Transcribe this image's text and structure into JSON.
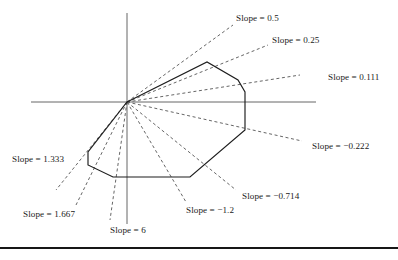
{
  "figure": {
    "title": "",
    "width": 398,
    "height": 260,
    "origin": {
      "x": 127,
      "y": 102
    },
    "axes": {
      "horizontal": {
        "x1": 31,
        "y1": 102,
        "x2": 316,
        "y2": 102
      },
      "vertical": {
        "x1": 127,
        "y1": 13,
        "x2": 127,
        "y2": 224
      }
    },
    "footer_rule": {
      "x1": 0,
      "y1": 248,
      "x2": 398,
      "y2": 248
    },
    "polygon": {
      "closed": true,
      "points": [
        {
          "x": 127,
          "y": 102
        },
        {
          "x": 207,
          "y": 62
        },
        {
          "x": 238,
          "y": 80
        },
        {
          "x": 245,
          "y": 92
        },
        {
          "x": 245,
          "y": 130
        },
        {
          "x": 190,
          "y": 177
        },
        {
          "x": 113,
          "y": 177
        },
        {
          "x": 88,
          "y": 165
        },
        {
          "x": 88,
          "y": 152
        }
      ]
    },
    "rays": [
      {
        "id": "ray-0-5",
        "slope": 0.5,
        "x2": 233,
        "y2": 25
      },
      {
        "id": "ray-0-25",
        "slope": 0.25,
        "x2": 268,
        "y2": 45
      },
      {
        "id": "ray-0-111",
        "slope": 0.111,
        "x2": 300,
        "y2": 75
      },
      {
        "id": "ray--0-222",
        "slope": -0.222,
        "x2": 302,
        "y2": 141
      },
      {
        "id": "ray--0-714",
        "slope": -0.714,
        "x2": 236,
        "y2": 190
      },
      {
        "id": "ray--1-2",
        "slope": -1.2,
        "x2": 186,
        "y2": 202
      },
      {
        "id": "ray-6",
        "slope": 6,
        "x2": 110,
        "y2": 220
      },
      {
        "id": "ray-1-667",
        "slope": 1.667,
        "x2": 76,
        "y2": 205
      },
      {
        "id": "ray-1-333",
        "slope": 1.333,
        "x2": 56,
        "y2": 190
      }
    ],
    "labels": [
      {
        "id": "label-0-5",
        "text": "Slope = 0.5",
        "x": 236,
        "y": 14
      },
      {
        "id": "label-0-25",
        "text": "Slope = 0.25",
        "x": 272,
        "y": 36
      },
      {
        "id": "label-0-111",
        "text": "Slope = 0.111",
        "x": 328,
        "y": 73
      },
      {
        "id": "label--0-222",
        "text": "Slope = −0.222",
        "x": 312,
        "y": 142
      },
      {
        "id": "label--0-714",
        "text": "Slope = −0.714",
        "x": 242,
        "y": 192
      },
      {
        "id": "label--1-2",
        "text": "Slope = −1.2",
        "x": 186,
        "y": 206
      },
      {
        "id": "label-6",
        "text": "Slope = 6",
        "x": 110,
        "y": 226
      },
      {
        "id": "label-1-667",
        "text": "Slope = 1.667",
        "x": 23,
        "y": 210
      },
      {
        "id": "label-1-333",
        "text": "Slope = 1.333",
        "x": 12,
        "y": 155
      }
    ]
  },
  "chart_data": {
    "type": "scatter",
    "title": "",
    "xlabel": "",
    "ylabel": "",
    "grid": false,
    "legend": "none",
    "slopes": [
      0.5,
      0.25,
      0.111,
      -0.222,
      -0.714,
      -1.2,
      6,
      1.667,
      1.333
    ],
    "slope_labels": [
      "Slope = 0.5",
      "Slope = 0.25",
      "Slope = 0.111",
      "Slope = −0.222",
      "Slope = −0.714",
      "Slope = −1.2",
      "Slope = 6",
      "Slope = 1.667",
      "Slope = 1.333"
    ]
  }
}
